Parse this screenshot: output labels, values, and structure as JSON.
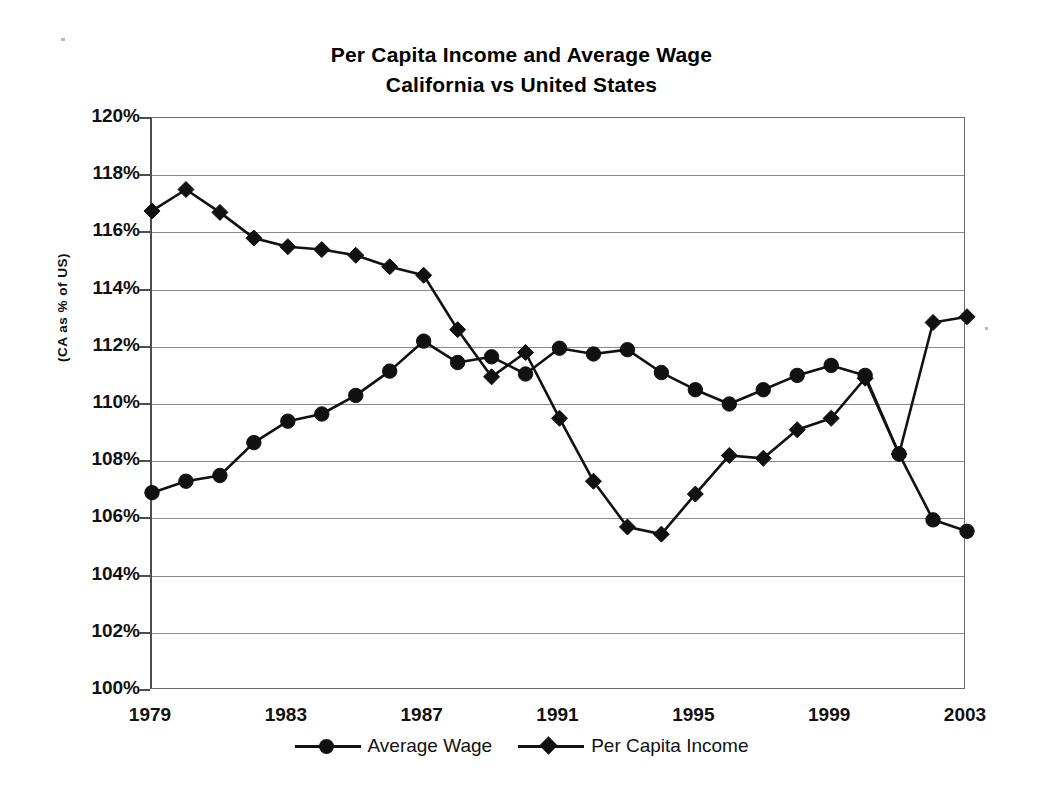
{
  "chart": {
    "title_line1": "Per Capita Income and Average Wage",
    "title_line2": "California vs United States",
    "y_axis_title": "(CA as % of US)"
  },
  "legend": {
    "items": [
      {
        "label": "Average Wage",
        "marker": "circle",
        "color": "#111111"
      },
      {
        "label": "Per Capita Income",
        "marker": "diamond",
        "color": "#111111"
      }
    ]
  },
  "y_ticks": [
    {
      "label": "120%",
      "value": 120
    },
    {
      "label": "118%",
      "value": 118
    },
    {
      "label": "116%",
      "value": 116
    },
    {
      "label": "114%",
      "value": 114
    },
    {
      "label": "112%",
      "value": 112
    },
    {
      "label": "110%",
      "value": 110
    },
    {
      "label": "108%",
      "value": 108
    },
    {
      "label": "106%",
      "value": 106
    },
    {
      "label": "104%",
      "value": 104
    },
    {
      "label": "102%",
      "value": 102
    },
    {
      "label": "100%",
      "value": 100
    }
  ],
  "x_ticks": [
    {
      "label": "1979",
      "value": 1979
    },
    {
      "label": "1983",
      "value": 1983
    },
    {
      "label": "1987",
      "value": 1987
    },
    {
      "label": "1991",
      "value": 1991
    },
    {
      "label": "1995",
      "value": 1995
    },
    {
      "label": "1999",
      "value": 1999
    },
    {
      "label": "2003",
      "value": 2003
    }
  ],
  "chart_data": {
    "type": "line",
    "title": "Per Capita Income and Average Wage California vs United States",
    "xlabel": "",
    "ylabel": "(CA as % of US)",
    "xlim": [
      1979,
      2003
    ],
    "ylim": [
      100,
      120
    ],
    "ytick_format": "percent",
    "ytick_step": 2,
    "xtick_step": 4,
    "grid": "horizontal",
    "legend_position": "bottom",
    "x": [
      1979,
      1980,
      1981,
      1982,
      1983,
      1984,
      1985,
      1986,
      1987,
      1988,
      1989,
      1990,
      1991,
      1992,
      1993,
      1994,
      1995,
      1996,
      1997,
      1998,
      1999,
      2000,
      2001,
      2002,
      2003
    ],
    "series": [
      {
        "name": "Average Wage",
        "marker": "circle",
        "color": "#111111",
        "values": [
          106.9,
          107.3,
          107.5,
          108.65,
          109.4,
          109.65,
          110.3,
          111.15,
          112.2,
          111.45,
          111.65,
          111.05,
          111.95,
          111.75,
          111.9,
          111.1,
          110.5,
          110.0,
          110.5,
          111.0,
          111.35,
          111.0,
          108.25,
          105.95,
          105.55
        ]
      },
      {
        "name": "Per Capita Income",
        "marker": "diamond",
        "color": "#111111",
        "values": [
          116.75,
          117.5,
          116.7,
          115.8,
          115.5,
          115.4,
          115.2,
          114.8,
          114.5,
          112.6,
          110.95,
          111.8,
          109.5,
          107.3,
          105.7,
          105.45,
          106.85,
          108.2,
          108.1,
          109.1,
          109.5,
          110.9,
          108.25,
          112.85,
          113.05
        ]
      }
    ]
  }
}
